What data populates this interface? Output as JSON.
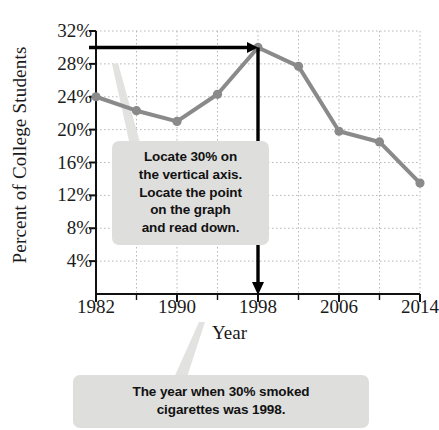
{
  "chart_data": {
    "type": "line",
    "title": "",
    "xlabel": "Year",
    "ylabel": "Percent of College Students",
    "x": [
      1982,
      1986,
      1990,
      1994,
      1998,
      2002,
      2006,
      2010,
      2014
    ],
    "values": [
      24.0,
      22.3,
      21.0,
      24.3,
      30.0,
      27.7,
      19.8,
      18.5,
      13.5
    ],
    "series": [
      {
        "name": "Percent of college students who smoked cigarettes",
        "values": [
          24.0,
          22.3,
          21.0,
          24.3,
          30.0,
          27.7,
          19.8,
          18.5,
          13.5
        ]
      }
    ],
    "xlim": [
      1982,
      2014
    ],
    "ylim": [
      0,
      32
    ],
    "xticks": [
      1982,
      1990,
      1998,
      2006,
      2014
    ],
    "xtick_labels": [
      "1982",
      "1990",
      "1998",
      "2006",
      "2014"
    ],
    "xminor_ticks": [
      1986,
      1994,
      2002,
      2010
    ],
    "yticks": [
      4,
      8,
      12,
      16,
      20,
      24,
      28,
      32
    ],
    "ytick_labels": [
      "4%",
      "8%",
      "12%",
      "16%",
      "20%",
      "24%",
      "28%",
      "32%"
    ],
    "grid": true,
    "legend": "none",
    "line_color": "#8a8a8a",
    "marker_color": "#8a8a8a",
    "annotation_color": "#000000",
    "callout_bg": "#dededd",
    "annotations": [
      {
        "name": "horizontal-read-line",
        "description": "Horizontal arrow from the 30% position on the vertical axis to the 1998 data point",
        "y_value": 30,
        "x_from": 1982,
        "x_to": 1998
      },
      {
        "name": "vertical-read-line",
        "description": "Vertical arrow from the 1998 data point down to the horizontal axis",
        "x_value": 1998,
        "y_from": 30,
        "y_to": 0
      }
    ]
  },
  "callouts": {
    "upper": {
      "lines": [
        "Locate 30% on",
        "the vertical axis.",
        "Locate the point",
        "on the graph",
        "and read down."
      ]
    },
    "lower": {
      "lines": [
        "The year when 30% smoked",
        "cigarettes was 1998."
      ]
    }
  }
}
